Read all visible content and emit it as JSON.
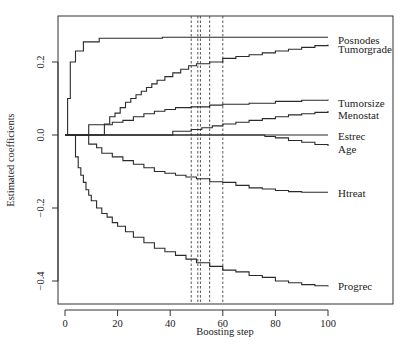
{
  "chart_data": {
    "type": "line",
    "title": "",
    "xlabel": "Boosting step",
    "ylabel": "Estimated coefficients",
    "xlim": [
      -3,
      112
    ],
    "ylim": [
      -0.46,
      0.325
    ],
    "xticks": [
      0,
      20,
      40,
      60,
      80,
      100
    ],
    "yticks": [
      -0.4,
      -0.2,
      0.0,
      0.2
    ],
    "xtick_labels": [
      "0",
      "20",
      "40",
      "60",
      "80",
      "100"
    ],
    "ytick_labels": [
      "-0.4",
      "-0.2",
      "0.0",
      "0.2"
    ],
    "grid": false,
    "legend": "labels at right end of each line",
    "vlines_dashed": [
      48,
      50.5,
      51.5,
      55,
      60
    ],
    "series": [
      {
        "name": "Posnodes",
        "x": [
          0,
          1,
          2,
          3,
          4,
          5,
          6,
          7,
          12,
          13,
          36,
          37,
          100
        ],
        "y": [
          0,
          0.1,
          0.2,
          0.2,
          0.23,
          0.23,
          0.23,
          0.255,
          0.255,
          0.265,
          0.265,
          0.268,
          0.268
        ]
      },
      {
        "name": "Tumorgrade",
        "x": [
          0,
          14,
          15,
          17,
          19,
          21,
          23,
          25,
          27,
          29,
          31,
          33,
          35,
          38,
          41,
          44,
          47,
          50,
          55,
          60,
          65,
          70,
          75,
          80,
          85,
          90,
          95,
          100
        ],
        "y": [
          0,
          0,
          0.03,
          0.05,
          0.06,
          0.075,
          0.09,
          0.1,
          0.11,
          0.12,
          0.13,
          0.14,
          0.15,
          0.16,
          0.17,
          0.18,
          0.19,
          0.195,
          0.2,
          0.21,
          0.215,
          0.22,
          0.225,
          0.23,
          0.235,
          0.24,
          0.245,
          0.248
        ]
      },
      {
        "name": "Tumorsize",
        "x": [
          0,
          8,
          9,
          14,
          18,
          22,
          26,
          30,
          34,
          38,
          42,
          48,
          55,
          60,
          70,
          80,
          90,
          100
        ],
        "y": [
          0,
          0,
          0.028,
          0.028,
          0.035,
          0.04,
          0.05,
          0.058,
          0.065,
          0.07,
          0.075,
          0.077,
          0.082,
          0.084,
          0.087,
          0.092,
          0.095,
          0.097
        ]
      },
      {
        "name": "Menostat",
        "x": [
          0,
          40,
          41,
          48,
          52,
          56,
          60,
          65,
          70,
          75,
          80,
          85,
          90,
          95,
          100
        ],
        "y": [
          0,
          0,
          0.01,
          0.015,
          0.02,
          0.025,
          0.03,
          0.035,
          0.04,
          0.045,
          0.05,
          0.055,
          0.058,
          0.062,
          0.066
        ]
      },
      {
        "name": "Estrec",
        "x": [
          0,
          100
        ],
        "y": [
          0,
          0
        ]
      },
      {
        "name": "Age",
        "x": [
          0,
          72,
          76,
          80,
          85,
          90,
          95,
          100
        ],
        "y": [
          0,
          0,
          -0.004,
          -0.008,
          -0.015,
          -0.02,
          -0.026,
          -0.03
        ]
      },
      {
        "name": "Htreat",
        "x": [
          0,
          8,
          9,
          12,
          14,
          18,
          22,
          26,
          30,
          34,
          38,
          42,
          46,
          50,
          55,
          60,
          65,
          70,
          75,
          80,
          85,
          90,
          100
        ],
        "y": [
          0,
          0,
          -0.025,
          -0.035,
          -0.05,
          -0.06,
          -0.07,
          -0.08,
          -0.09,
          -0.1,
          -0.105,
          -0.11,
          -0.115,
          -0.12,
          -0.128,
          -0.13,
          -0.138,
          -0.145,
          -0.148,
          -0.152,
          -0.155,
          -0.157,
          -0.157
        ]
      },
      {
        "name": "Progrec",
        "x": [
          0,
          3,
          4,
          5,
          6,
          7,
          8,
          9,
          10,
          12,
          14,
          16,
          18,
          20,
          23,
          26,
          30,
          34,
          38,
          42,
          46,
          50,
          55,
          60,
          65,
          70,
          75,
          80,
          85,
          90,
          95,
          100
        ],
        "y": [
          0,
          0,
          -0.06,
          -0.09,
          -0.11,
          -0.13,
          -0.15,
          -0.165,
          -0.18,
          -0.2,
          -0.215,
          -0.225,
          -0.24,
          -0.25,
          -0.265,
          -0.28,
          -0.295,
          -0.31,
          -0.32,
          -0.33,
          -0.34,
          -0.35,
          -0.36,
          -0.37,
          -0.375,
          -0.385,
          -0.39,
          -0.4,
          -0.405,
          -0.41,
          -0.413,
          -0.415
        ]
      }
    ]
  },
  "labels": {
    "xlabel": "Boosting step",
    "ylabel": "Estimated coefficients"
  }
}
